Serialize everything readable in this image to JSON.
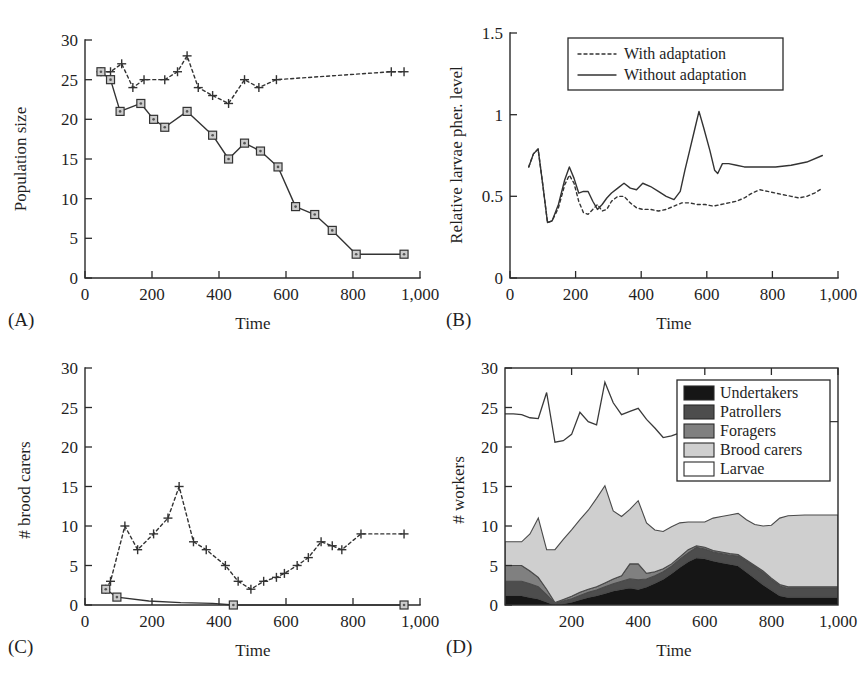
{
  "figure": {
    "background": "#ffffff",
    "ink_color": "#333333"
  },
  "panels": [
    {
      "id": "A",
      "label": "(A)",
      "ylabel": "Population size",
      "xlabel": "Time",
      "ylim": [
        0,
        30
      ],
      "xlim": [
        0,
        1050
      ],
      "yticks": [
        0,
        5,
        10,
        15,
        20,
        25,
        30
      ],
      "yticklabels": [
        "0",
        "5",
        "10",
        "15",
        "20",
        "25",
        "30"
      ],
      "xticks": [
        0,
        200,
        400,
        600,
        800,
        1000
      ],
      "xticklabels": [
        "0",
        "200",
        "400",
        "600",
        "800",
        "1,000"
      ]
    },
    {
      "id": "B",
      "label": "(B)",
      "ylabel": "Relative larvae pher. level",
      "xlabel": "Time",
      "ylim": [
        0,
        1.5
      ],
      "xlim": [
        0,
        1050
      ],
      "yticks": [
        0,
        0.5,
        1,
        1.5
      ],
      "yticklabels": [
        "0",
        "0.5",
        "1",
        "1.5"
      ],
      "xticks": [
        0,
        200,
        400,
        600,
        800,
        1000
      ],
      "xticklabels": [
        "0",
        "200",
        "400",
        "600",
        "800",
        "1,000"
      ]
    },
    {
      "id": "C",
      "label": "(C)",
      "ylabel": "# brood carers",
      "xlabel": "Time",
      "ylim": [
        0,
        30
      ],
      "xlim": [
        0,
        1050
      ],
      "yticks": [
        0,
        5,
        10,
        15,
        20,
        25,
        30
      ],
      "yticklabels": [
        "0",
        "5",
        "10",
        "15",
        "20",
        "25",
        "30"
      ],
      "xticks": [
        0,
        200,
        400,
        600,
        800,
        1000
      ],
      "xticklabels": [
        "0",
        "200",
        "400",
        "600",
        "800",
        "1,000"
      ]
    },
    {
      "id": "D",
      "label": "(D)",
      "ylabel": "# workers",
      "xlabel": "Time",
      "ylim": [
        0,
        30
      ],
      "xlim": [
        0,
        1000
      ],
      "yticks": [
        0,
        5,
        10,
        15,
        20,
        25,
        30
      ],
      "yticklabels": [
        "0",
        "5",
        "10",
        "15",
        "20",
        "25",
        "30"
      ],
      "xticks": [
        200,
        400,
        600,
        800,
        1000
      ],
      "xticklabels": [
        "200",
        "400",
        "600",
        "800",
        "1,000"
      ]
    }
  ],
  "chart_data": [
    {
      "type": "line",
      "panel": "A",
      "title": "",
      "xlabel": "Time",
      "ylabel": "Population size",
      "xlim": [
        0,
        1050
      ],
      "ylim": [
        0,
        30
      ],
      "grid": false,
      "legend": "none",
      "series": [
        {
          "name": "with-adaptation",
          "style": "dotted-plus",
          "x": [
            50,
            80,
            115,
            150,
            185,
            250,
            290,
            320,
            355,
            400,
            450,
            500,
            545,
            600,
            960,
            1000
          ],
          "values": [
            26,
            26,
            27,
            24,
            25,
            25,
            26,
            28,
            24,
            23,
            22,
            25,
            24,
            25,
            26,
            26
          ]
        },
        {
          "name": "without-adaptation",
          "style": "solid-square",
          "x": [
            50,
            80,
            110,
            175,
            215,
            250,
            320,
            400,
            450,
            500,
            550,
            605,
            660,
            720,
            775,
            850,
            1000
          ],
          "values": [
            26,
            25,
            21,
            22,
            20,
            19,
            21,
            18,
            15,
            17,
            16,
            14,
            9,
            8,
            6,
            3,
            3
          ]
        }
      ]
    },
    {
      "type": "line",
      "panel": "B",
      "title": "",
      "xlabel": "Time",
      "ylabel": "Relative larvae pher. level",
      "xlim": [
        0,
        1050
      ],
      "ylim": [
        0,
        1.5
      ],
      "grid": false,
      "legend": "top-center-inside",
      "legend_entries": [
        "With adaptation",
        "Without adaptation"
      ],
      "series": [
        {
          "name": "With adaptation",
          "style": "dotted",
          "x": [
            60,
            75,
            90,
            105,
            120,
            135,
            155,
            175,
            190,
            205,
            220,
            235,
            250,
            265,
            280,
            295,
            310,
            325,
            345,
            365,
            385,
            405,
            425,
            450,
            475,
            500,
            525,
            550,
            575,
            600,
            625,
            650,
            675,
            700,
            725,
            750,
            775,
            800,
            825,
            850,
            875,
            900,
            925,
            950,
            975,
            1000
          ],
          "values": [
            0.68,
            0.76,
            0.79,
            0.57,
            0.34,
            0.35,
            0.43,
            0.57,
            0.63,
            0.58,
            0.47,
            0.4,
            0.39,
            0.42,
            0.45,
            0.41,
            0.42,
            0.47,
            0.5,
            0.5,
            0.46,
            0.43,
            0.42,
            0.42,
            0.41,
            0.42,
            0.44,
            0.46,
            0.46,
            0.45,
            0.45,
            0.44,
            0.45,
            0.46,
            0.47,
            0.49,
            0.52,
            0.54,
            0.53,
            0.52,
            0.51,
            0.5,
            0.49,
            0.5,
            0.52,
            0.55
          ]
        },
        {
          "name": "Without adaptation",
          "style": "solid",
          "x": [
            60,
            75,
            90,
            105,
            120,
            135,
            155,
            175,
            190,
            205,
            220,
            235,
            250,
            265,
            280,
            295,
            310,
            325,
            345,
            365,
            385,
            405,
            425,
            450,
            475,
            500,
            525,
            545,
            560,
            575,
            590,
            605,
            620,
            640,
            655,
            665,
            680,
            700,
            725,
            750,
            800,
            850,
            900,
            950,
            1000
          ],
          "values": [
            0.68,
            0.76,
            0.79,
            0.57,
            0.34,
            0.35,
            0.45,
            0.6,
            0.68,
            0.61,
            0.52,
            0.53,
            0.53,
            0.47,
            0.42,
            0.45,
            0.49,
            0.52,
            0.55,
            0.58,
            0.55,
            0.54,
            0.58,
            0.56,
            0.53,
            0.5,
            0.48,
            0.53,
            0.66,
            0.78,
            0.9,
            1.02,
            0.92,
            0.78,
            0.66,
            0.64,
            0.7,
            0.7,
            0.69,
            0.68,
            0.68,
            0.68,
            0.69,
            0.71,
            0.75
          ]
        }
      ]
    },
    {
      "type": "line",
      "panel": "C",
      "title": "",
      "xlabel": "Time",
      "ylabel": "# brood carers",
      "xlim": [
        0,
        1050
      ],
      "ylim": [
        0,
        30
      ],
      "grid": false,
      "legend": "none",
      "series": [
        {
          "name": "with-adaptation",
          "style": "dotted-plus",
          "x": [
            65,
            80,
            125,
            165,
            215,
            260,
            295,
            340,
            380,
            440,
            480,
            520,
            560,
            600,
            625,
            665,
            700,
            740,
            775,
            805,
            865,
            1000
          ],
          "values": [
            2,
            3,
            10,
            7,
            9,
            11,
            15,
            8,
            7,
            5,
            3,
            2,
            3,
            3.5,
            4,
            5,
            6,
            8,
            7.5,
            7,
            9,
            9
          ]
        },
        {
          "name": "without-adaptation",
          "style": "solid-square",
          "x": [
            65,
            100,
            200,
            300,
            400,
            465,
            600,
            800,
            1000
          ],
          "values": [
            2,
            1,
            0.5,
            0.3,
            0.2,
            0,
            0,
            0,
            0
          ]
        }
      ]
    },
    {
      "type": "area",
      "panel": "D",
      "title": "",
      "xlabel": "Time",
      "ylabel": "# workers",
      "xlim": [
        0,
        1000
      ],
      "ylim": [
        0,
        30
      ],
      "grid": false,
      "stacked": true,
      "legend": "top-right-inside",
      "legend_entries": [
        {
          "label": "Undertakers",
          "color": "#161616"
        },
        {
          "label": "Patrollers",
          "color": "#4d4d4d"
        },
        {
          "label": "Foragers",
          "color": "#808080"
        },
        {
          "label": "Brood carers",
          "color": "#cfcfcf"
        },
        {
          "label": "Larvae",
          "color": "#ffffff"
        }
      ],
      "x": [
        0,
        25,
        50,
        75,
        100,
        125,
        150,
        175,
        200,
        225,
        250,
        275,
        300,
        325,
        350,
        375,
        400,
        425,
        450,
        475,
        500,
        525,
        550,
        575,
        600,
        625,
        650,
        675,
        700,
        725,
        750,
        775,
        800,
        825,
        850,
        900,
        950,
        1000
      ],
      "series": [
        {
          "name": "Undertakers",
          "color": "#161616",
          "values": [
            1.2,
            1.2,
            1.2,
            1.0,
            0.8,
            0.4,
            0.0,
            0.2,
            0.4,
            0.7,
            1.0,
            1.2,
            1.5,
            1.8,
            2.0,
            2.2,
            2.0,
            2.3,
            2.8,
            3.3,
            4.0,
            4.8,
            5.5,
            6.0,
            5.9,
            5.6,
            5.4,
            5.2,
            5.0,
            4.2,
            3.4,
            2.6,
            1.9,
            1.2,
            1.0,
            1.0,
            1.0,
            1.0
          ]
        },
        {
          "name": "Patrollers",
          "color": "#4d4d4d",
          "values": [
            1.8,
            1.8,
            1.8,
            1.7,
            1.5,
            0.9,
            0.2,
            0.3,
            0.4,
            0.5,
            0.6,
            0.7,
            0.8,
            0.9,
            1.0,
            1.1,
            1.2,
            1.0,
            0.9,
            0.9,
            0.9,
            1.0,
            1.1,
            1.3,
            1.2,
            1.1,
            1.1,
            1.1,
            1.2,
            1.3,
            1.4,
            1.5,
            1.3,
            1.2,
            1.1,
            1.1,
            1.1,
            1.1
          ]
        },
        {
          "name": "Foragers",
          "color": "#808080",
          "values": [
            2.0,
            2.0,
            2.0,
            1.6,
            1.2,
            0.7,
            0.1,
            0.2,
            0.3,
            0.4,
            0.4,
            0.4,
            0.5,
            0.6,
            0.7,
            1.9,
            2.0,
            0.7,
            0.5,
            0.4,
            0.3,
            0.3,
            0.4,
            0.2,
            0.2,
            0.2,
            0.2,
            0.2,
            0.2,
            0.2,
            0.2,
            0.2,
            0.2,
            0.2,
            0.2,
            0.2,
            0.2,
            0.2
          ]
        },
        {
          "name": "Brood carers",
          "color": "#cfcfcf",
          "values": [
            3.0,
            3.0,
            3.0,
            4.7,
            7.5,
            5.0,
            6.7,
            7.6,
            8.4,
            9.2,
            10.0,
            11.2,
            12.3,
            8.6,
            7.5,
            6.9,
            8.0,
            6.4,
            5.3,
            4.7,
            4.7,
            4.3,
            3.5,
            3.0,
            3.2,
            4.1,
            4.5,
            4.9,
            5.2,
            5.1,
            5.2,
            5.7,
            6.7,
            8.4,
            9.0,
            9.1,
            9.1,
            9.1
          ]
        },
        {
          "name": "Larvae",
          "color": "#ffffff",
          "values": [
            24.2,
            24.2,
            24.1,
            23.7,
            23.6,
            26.9,
            20.6,
            20.8,
            21.6,
            24.4,
            23.2,
            22.8,
            28.2,
            25.6,
            24.1,
            24.5,
            24.9,
            23.5,
            22.4,
            21.2,
            21.4,
            21.8,
            22.2,
            22.8,
            23.1,
            23.2,
            23.2,
            23.2,
            23.2,
            23.2,
            23.2,
            23.2,
            23.2,
            23.2,
            23.2,
            23.2,
            23.2,
            23.2
          ]
        }
      ]
    }
  ]
}
